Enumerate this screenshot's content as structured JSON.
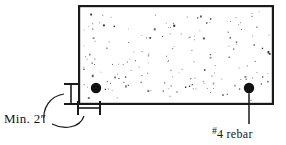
{
  "figure": {
    "type": "engineering-detail-drawing",
    "background_color": "#ffffff",
    "ink_color": "#151515"
  },
  "slab": {
    "name": "concrete-section",
    "x": 78,
    "y": 5,
    "width": 196,
    "height": 100,
    "border_color": "#1a1a1a",
    "border_width": 2.2,
    "fill_color": "#ffffff",
    "aggregate_speckle_color": "#2b2b2b",
    "speckle_count": 168
  },
  "rebars": [
    {
      "name": "rebar-left",
      "cx": 96,
      "cy": 88,
      "r": 5.2,
      "color": "#111111"
    },
    {
      "name": "rebar-right",
      "cx": 249,
      "cy": 88,
      "r": 5.2,
      "color": "#111111"
    }
  ],
  "dimensions": [
    {
      "name": "vertical-cover-dimension",
      "orientation": "vertical",
      "x": 71,
      "y_top": 84,
      "y_bottom": 104,
      "tick_half_length": 7,
      "line_color": "#1a1a1a"
    },
    {
      "name": "horizontal-cover-dimension",
      "orientation": "horizontal",
      "y": 108,
      "x_left": 78,
      "x_right": 100,
      "tick_half_length": 7,
      "line_color": "#1a1a1a"
    }
  ],
  "leaders": [
    {
      "name": "leader-min-cover-upper",
      "from": "Min. 2″ label",
      "to": "vertical-cover-dimension"
    },
    {
      "name": "leader-min-cover-lower",
      "from": "Min. 2″ label",
      "to": "horizontal-cover-dimension"
    },
    {
      "name": "leader-rebar-callout",
      "from": "#4 rebar label",
      "to": "rebar-right"
    }
  ],
  "labels": {
    "min_cover": {
      "name": "min-cover-label",
      "prefix": "Min. ",
      "value": "2",
      "unit_symbol": "″",
      "full_text": "Min. 2″"
    },
    "rebar_callout": {
      "name": "rebar-callout-label",
      "hash_symbol": "#",
      "bar_size": "4",
      "bar_word": "rebar",
      "full_text": "#4 rebar"
    }
  }
}
